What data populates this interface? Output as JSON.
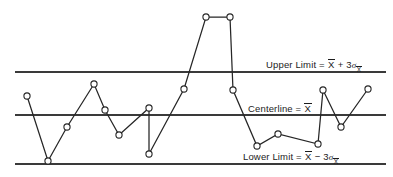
{
  "chart_data": {
    "type": "line",
    "title": "",
    "xlabel": "",
    "ylabel": "",
    "grid": false,
    "legend_position": "inline-right",
    "xlim": [
      0,
      19
    ],
    "ylim": [
      0,
      100
    ],
    "series": [
      {
        "name": "sample-averages",
        "x": [
          1,
          2,
          3,
          4,
          5,
          6,
          7,
          8,
          9,
          10,
          11,
          12,
          13,
          14,
          15,
          16,
          17,
          18
        ],
        "values": [
          62,
          22,
          43,
          68,
          54,
          39,
          56,
          28,
          66,
          107,
          107,
          65,
          24,
          30,
          26,
          66,
          45,
          67
        ]
      }
    ],
    "reference_lines": [
      {
        "name": "upper-limit",
        "value": 88,
        "label": "Upper Limit = X̅ + 3σX̅"
      },
      {
        "name": "centerline",
        "value": 60,
        "label": "Centerline = X̅"
      },
      {
        "name": "lower-limit",
        "value": 28,
        "label": "Lower Limit = X̅ − 3σX̅"
      }
    ]
  },
  "labels": {
    "upper": {
      "prefix": "Upper Limit",
      "equals": "=",
      "xbar": "X",
      "operator": "+",
      "coefficient": "3",
      "sigma": "σ",
      "subscript": "X"
    },
    "center": {
      "prefix": "Centerline",
      "equals": "=",
      "xbar": "X"
    },
    "lower": {
      "prefix": "Lower Limit",
      "equals": "=",
      "xbar": "X",
      "operator": "−",
      "coefficient": "3",
      "sigma": "σ",
      "subscript": "X"
    }
  },
  "geometry": {
    "upper_limit_y": 72,
    "centerline_y": 115,
    "lower_limit_y": 164,
    "line_x_start": 15,
    "line_x_end": 386,
    "marker_radius": 3.1,
    "points_px": [
      [
        27,
        96
      ],
      [
        48,
        161
      ],
      [
        67,
        127
      ],
      [
        94,
        84
      ],
      [
        105,
        110
      ],
      [
        119,
        135
      ],
      [
        149,
        108
      ],
      [
        149,
        154
      ],
      [
        184,
        89
      ],
      [
        206,
        17
      ],
      [
        230,
        17
      ],
      [
        233,
        90
      ],
      [
        257,
        146
      ],
      [
        278,
        134
      ],
      [
        318,
        144
      ],
      [
        323,
        90
      ],
      [
        341,
        127
      ],
      [
        368,
        89
      ]
    ]
  },
  "colors": {
    "background": "#ffffff",
    "line": "#262626",
    "limit_line": "#3a3a3a",
    "marker_fill": "#ffffff",
    "text": "#1c1c1c"
  }
}
